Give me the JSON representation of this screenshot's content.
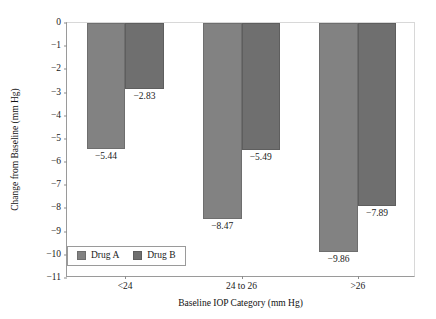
{
  "chart_data": {
    "type": "bar",
    "title": "",
    "xlabel": "Baseline IOP Category (mm Hg)",
    "ylabel": "Change from Baseline (mm Hg)",
    "categories": [
      "<24",
      "24 to 26",
      ">26"
    ],
    "series": [
      {
        "name": "Drug A",
        "values": [
          -5.44,
          -8.47,
          -9.86
        ],
        "color": "#828282"
      },
      {
        "name": "Drug B",
        "values": [
          -2.83,
          -5.49,
          -7.89
        ],
        "color": "#6f6f6f"
      }
    ],
    "data_labels": [
      [
        "−5.44",
        "−8.47",
        "−9.86"
      ],
      [
        "−2.83",
        "−5.49",
        "−7.89"
      ]
    ],
    "ylim": [
      -11,
      0
    ],
    "ytick_values": [
      0,
      -1,
      -2,
      -3,
      -4,
      -5,
      -6,
      -7,
      -8,
      -9,
      -10,
      -11
    ],
    "ytick_labels": [
      "0",
      "−1",
      "−2",
      "−3",
      "−4",
      "−5",
      "−6",
      "−7",
      "−8",
      "−9",
      "−10",
      "−11"
    ],
    "grid": false,
    "legend_position": "bottom-left",
    "legend_entries": [
      "Drug A",
      "Drug B"
    ]
  }
}
